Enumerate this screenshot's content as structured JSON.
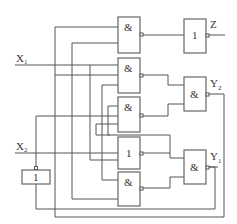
{
  "diagram": {
    "type": "logic-circuit",
    "inputs": [
      {
        "label": "X",
        "sub": "1"
      },
      {
        "label": "X",
        "sub": "2"
      }
    ],
    "outputs": [
      {
        "label": "Z",
        "sub": ""
      },
      {
        "label": "Y",
        "sub": "2"
      },
      {
        "label": "Y",
        "sub": "1"
      }
    ],
    "gates": [
      {
        "id": "g1",
        "symbol": "&",
        "negated_output": true
      },
      {
        "id": "g2",
        "symbol": "&",
        "negated_output": true
      },
      {
        "id": "g3",
        "symbol": "&",
        "negated_output": true
      },
      {
        "id": "g4",
        "symbol": "1",
        "negated_output": true
      },
      {
        "id": "g5",
        "symbol": "&",
        "negated_output": true
      },
      {
        "id": "gz",
        "symbol": "1",
        "negated_output": true
      },
      {
        "id": "gy2",
        "symbol": "&",
        "negated_output": true
      },
      {
        "id": "gy1",
        "symbol": "&",
        "negated_output": true
      },
      {
        "id": "ginv",
        "symbol": "1",
        "negated_output": true
      }
    ]
  }
}
